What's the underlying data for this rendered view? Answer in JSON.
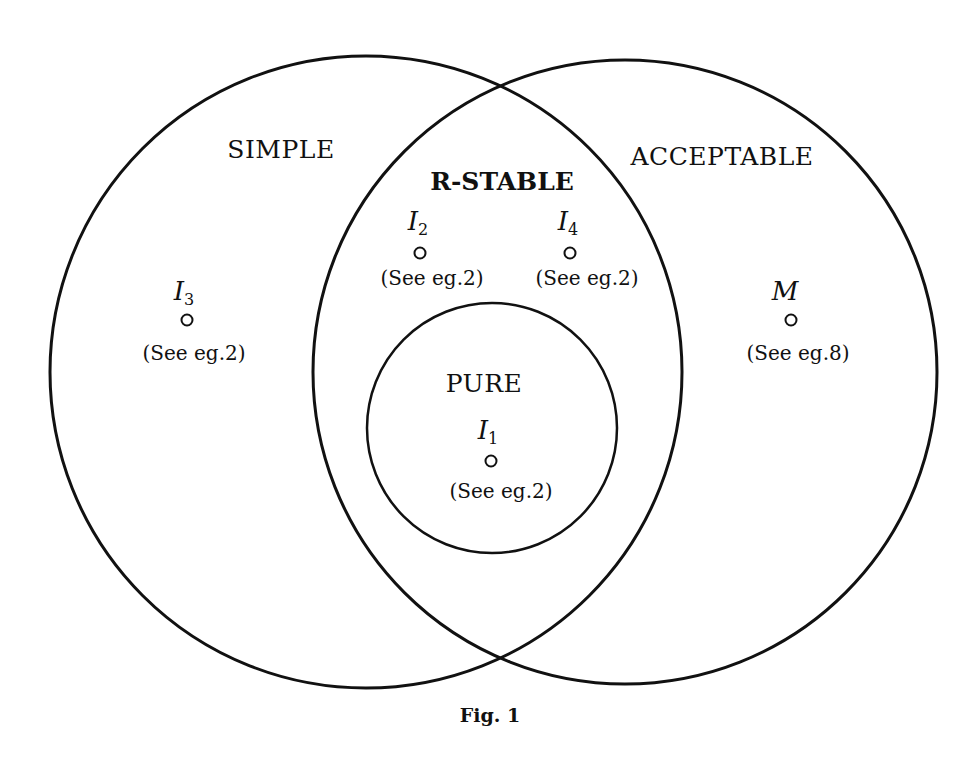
{
  "diagram": {
    "type": "venn",
    "sets": [
      {
        "id": "simple",
        "label": "SIMPLE"
      },
      {
        "id": "acceptable",
        "label": "ACCEPTABLE"
      },
      {
        "id": "r_stable",
        "label": "R-STABLE",
        "note": "intersection of SIMPLE and ACCEPTABLE"
      },
      {
        "id": "pure",
        "label": "PURE",
        "note": "inside R-STABLE"
      }
    ],
    "elements": [
      {
        "name": "I",
        "sub": "1",
        "ref": "(See eg.2)",
        "region": "pure"
      },
      {
        "name": "I",
        "sub": "2",
        "ref": "(See eg.2)",
        "region": "r_stable"
      },
      {
        "name": "I",
        "sub": "3",
        "ref": "(See eg.2)",
        "region": "simple"
      },
      {
        "name": "I",
        "sub": "4",
        "ref": "(See eg.2)",
        "region": "r_stable"
      },
      {
        "name": "M",
        "sub": "",
        "ref": "(See eg.8)",
        "region": "acceptable"
      }
    ],
    "caption": "Fig. 1",
    "stroke_color": "#111111"
  }
}
